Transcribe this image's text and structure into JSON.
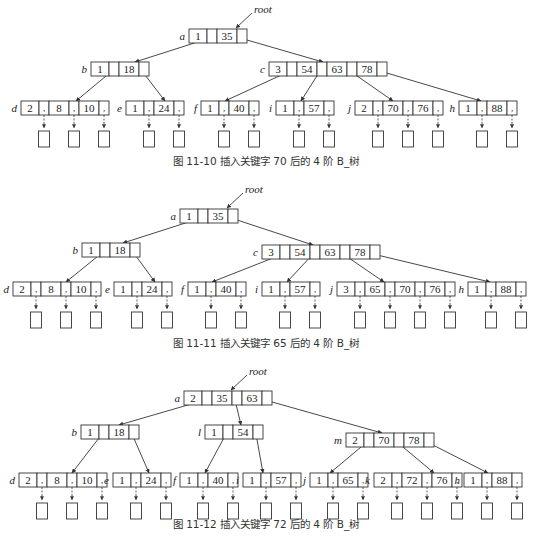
{
  "figures": [
    {
      "caption": "图 11-10   插入关键字 70 后的 4 阶 B_树",
      "root_label": "root",
      "nodes": {
        "a": {
          "label": "a",
          "n": "1",
          "keys": [
            "35"
          ]
        },
        "b": {
          "label": "b",
          "n": "1",
          "keys": [
            "18"
          ]
        },
        "c": {
          "label": "c",
          "n": "3",
          "keys": [
            "54",
            "63",
            "78"
          ]
        },
        "d": {
          "label": "d",
          "n": "2",
          "keys": [
            "8",
            "10"
          ]
        },
        "e": {
          "label": "e",
          "n": "1",
          "keys": [
            "24"
          ]
        },
        "f": {
          "label": "f",
          "n": "1",
          "keys": [
            "40"
          ]
        },
        "i": {
          "label": "i",
          "n": "1",
          "keys": [
            "57"
          ]
        },
        "j": {
          "label": "j",
          "n": "2",
          "keys": [
            "70",
            "76"
          ]
        },
        "h": {
          "label": "h",
          "n": "1",
          "keys": [
            "88"
          ]
        }
      }
    },
    {
      "caption": "图 11-11   插入关键字 65 后的 4 阶 B_树",
      "root_label": "root",
      "nodes": {
        "a": {
          "label": "a",
          "n": "1",
          "keys": [
            "35"
          ]
        },
        "b": {
          "label": "b",
          "n": "1",
          "keys": [
            "18"
          ]
        },
        "c": {
          "label": "c",
          "n": "3",
          "keys": [
            "54",
            "63",
            "78"
          ]
        },
        "d": {
          "label": "d",
          "n": "2",
          "keys": [
            "8",
            "10"
          ]
        },
        "e": {
          "label": "e",
          "n": "1",
          "keys": [
            "24"
          ]
        },
        "f": {
          "label": "f",
          "n": "1",
          "keys": [
            "40"
          ]
        },
        "i": {
          "label": "i",
          "n": "1",
          "keys": [
            "57"
          ]
        },
        "j": {
          "label": "j",
          "n": "3",
          "keys": [
            "65",
            "70",
            "76"
          ]
        },
        "h": {
          "label": "h",
          "n": "1",
          "keys": [
            "88"
          ]
        }
      }
    },
    {
      "caption": "图 11-12   插入关键字 72 后的 4 阶 B_树",
      "root_label": "root",
      "nodes": {
        "a": {
          "label": "a",
          "n": "2",
          "keys": [
            "35",
            "63"
          ]
        },
        "b": {
          "label": "b",
          "n": "1",
          "keys": [
            "18"
          ]
        },
        "l": {
          "label": "l",
          "n": "1",
          "keys": [
            "54"
          ]
        },
        "m": {
          "label": "m",
          "n": "2",
          "keys": [
            "70",
            "78"
          ]
        },
        "d": {
          "label": "d",
          "n": "2",
          "keys": [
            "8",
            "10"
          ]
        },
        "e": {
          "label": "e",
          "n": "1",
          "keys": [
            "24"
          ]
        },
        "f": {
          "label": "f",
          "n": "1",
          "keys": [
            "40"
          ]
        },
        "i": {
          "label": "i",
          "n": "1",
          "keys": [
            "57"
          ]
        },
        "j": {
          "label": "j",
          "n": "1",
          "keys": [
            "65"
          ]
        },
        "k": {
          "label": "k",
          "n": "2",
          "keys": [
            "72",
            "76"
          ]
        },
        "h": {
          "label": "h",
          "n": "1",
          "keys": [
            "88"
          ]
        }
      }
    }
  ]
}
